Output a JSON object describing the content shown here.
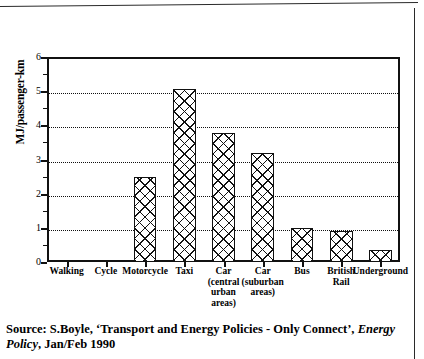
{
  "chart_data": {
    "type": "bar",
    "title": "",
    "xlabel": "",
    "ylabel": "MJ/passenger-km",
    "ylim": [
      0,
      6
    ],
    "yticks": [
      0,
      1,
      2,
      3,
      4,
      5,
      6
    ],
    "ytick_labels": [
      "0",
      "1",
      "2",
      "3",
      "4",
      "5",
      "6"
    ],
    "minor_tick_interval": 0.5,
    "grid": true,
    "grid_style": "dotted",
    "grid_axis": "y",
    "legend": null,
    "bar_fill": "cross-hatch",
    "categories": [
      "Walking",
      "Cycle",
      "Motorcycle",
      "Taxi",
      "Car (central urban areas)",
      "Car (suburban areas)",
      "Bus",
      "British Rail",
      "Underground"
    ],
    "category_label_lines": [
      [
        "Walking"
      ],
      [
        "Cycle"
      ],
      [
        "Motorcycle"
      ],
      [
        "Taxi"
      ],
      [
        "Car",
        "(central",
        "urban",
        "areas)"
      ],
      [
        "Car",
        "(suburban",
        "areas)"
      ],
      [
        "Bus"
      ],
      [
        "British",
        "Rail"
      ],
      [
        "Underground"
      ]
    ],
    "values": [
      0.03,
      0.03,
      2.5,
      5.05,
      3.78,
      3.2,
      1.0,
      0.9,
      0.35
    ]
  },
  "source": {
    "line1_prefix": "Source: S.Boyle, ‘Transport and Energy Policies - Only Connect’, ",
    "line1_italic": "Energy",
    "line2_italic": "Policy",
    "line2_rest": ", Jan/Feb 1990"
  },
  "colors": {
    "ink": "#111111",
    "background": "#ffffff",
    "border": "#2a2a2a"
  }
}
